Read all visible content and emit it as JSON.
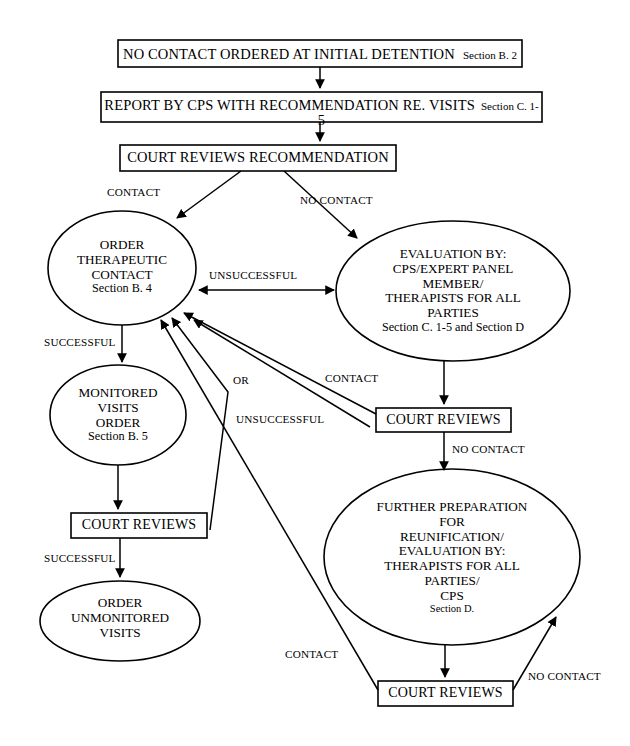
{
  "diagram": {
    "stroke_color": "#000000",
    "fill_color": "#ffffff",
    "background": "#ffffff",
    "nodes": {
      "no_contact_ordered": {
        "shape": "box",
        "main": "NO CONTACT ORDERED AT INITIAL DETENTION",
        "section": "Section  B. 2"
      },
      "report_by_cps": {
        "shape": "box",
        "main": "REPORT BY CPS WITH RECOMMENDATION RE. VISITS",
        "section": "Section C. 1-",
        "section_wrap": "5"
      },
      "court_reviews_recommendation": {
        "shape": "box",
        "main": "COURT REVIEWS RECOMMENDATION"
      },
      "order_therapeutic_contact": {
        "shape": "ellipse",
        "line1": "ORDER",
        "line2": "THERAPEUTIC",
        "line3": "CONTACT",
        "section": "Section B. 4"
      },
      "evaluation_by": {
        "shape": "ellipse",
        "line1": "EVALUATION BY:",
        "line2": "CPS/EXPERT PANEL",
        "line3": "MEMBER/",
        "line4": "THERAPISTS FOR ALL",
        "line5": "PARTIES",
        "section": "Section C. 1-5 and Section D"
      },
      "monitored_visits_order": {
        "shape": "ellipse",
        "line1": "MONITORED",
        "line2": "VISITS",
        "line3": "ORDER",
        "section": "Section B. 5"
      },
      "court_reviews_left": {
        "shape": "box",
        "main": "COURT REVIEWS"
      },
      "court_reviews_right": {
        "shape": "box",
        "main": "COURT REVIEWS"
      },
      "court_reviews_bottom": {
        "shape": "box",
        "main": "COURT REVIEWS"
      },
      "order_unmonitored_visits": {
        "shape": "ellipse",
        "line1": "ORDER",
        "line2": "UNMONITORED",
        "line3": "VISITS"
      },
      "further_preparation": {
        "shape": "ellipse",
        "line1": "FURTHER PREPARATION",
        "line2": "FOR",
        "line3": "REUNIFICATION/",
        "line4": "EVALUATION BY:",
        "line5": "THERAPISTS FOR ALL",
        "line6": "PARTIES/",
        "line7": "CPS",
        "section": "Section D."
      }
    },
    "edge_labels": {
      "contact_top": "CONTACT",
      "no_contact_top": "NO CONTACT",
      "unsuccessful_mid": "UNSUCCESSFUL",
      "successful_left": "SUCCESSFUL",
      "or_mid": "OR",
      "contact_mid": "CONTACT",
      "unsuccessful_low": "UNSUCCESSFUL",
      "no_contact_right": "NO CONTACT",
      "successful_low": "SUCCESSFUL",
      "contact_bottom": "CONTACT",
      "no_contact_bottom": "NO CONTACT"
    }
  }
}
